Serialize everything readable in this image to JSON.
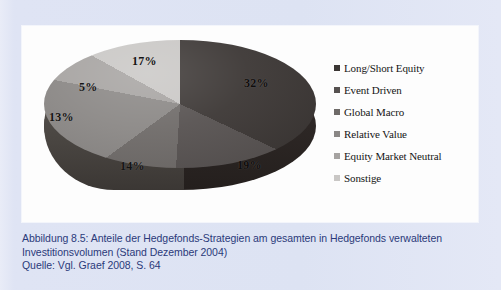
{
  "figure": {
    "panel_background": "#fdfdfd",
    "page_background": "#dfe4f4"
  },
  "legend": {
    "position": "right",
    "items": [
      {
        "label": "Long/Short Equity",
        "color": "#3b3634"
      },
      {
        "label": "Event Driven",
        "color": "#565150"
      },
      {
        "label": "Global Macro",
        "color": "#6e6a68"
      },
      {
        "label": "Relative Value",
        "color": "#8a8785"
      },
      {
        "label": "Equity Market Neutral",
        "color": "#a6a3a1"
      },
      {
        "label": "Sonstige",
        "color": "#c9c7c5"
      }
    ]
  },
  "caption": {
    "line1": "Abbildung 8.5:  Anteile der Hedgefonds-Strategien am gesamten in Hedgefonds verwalteten",
    "line2": "Investitionsvolumen (Stand Dezember 2004)",
    "line3": "Quelle: Vgl. Graef 2008, S. 64"
  },
  "chart_data": {
    "type": "pie",
    "title": "Anteile der Hedgefonds-Strategien am gesamten in Hedgefonds verwalteten Investitionsvolumen (Stand Dezember 2004)",
    "subtitle": "Quelle: Vgl. Graef 2008, S. 64",
    "xlabel": "",
    "ylabel": "",
    "grid": false,
    "legend_position": "right",
    "value_unit": "%",
    "start_angle_deg": 0,
    "direction": "clockwise",
    "three_d": true,
    "categories": [
      "Long/Short Equity",
      "Event Driven",
      "Global Macro",
      "Relative Value",
      "Equity Market Neutral",
      "Sonstige"
    ],
    "values": [
      32,
      19,
      14,
      13,
      5,
      17
    ],
    "labels": [
      "32%",
      "19%",
      "14%",
      "13%",
      "5%",
      "17%"
    ],
    "colors": [
      "#3b3634",
      "#565150",
      "#6e6a68",
      "#8a8785",
      "#a6a3a1",
      "#c9c7c5"
    ],
    "slice_label_positions": [
      {
        "label": "32%",
        "left": 212,
        "top": 44
      },
      {
        "label": "19%",
        "left": 205,
        "top": 126
      },
      {
        "label": "14%",
        "left": 88,
        "top": 127
      },
      {
        "label": "13%",
        "left": 17,
        "top": 78
      },
      {
        "label": "5%",
        "left": 47,
        "top": 48
      },
      {
        "label": "17%",
        "left": 100,
        "top": 22
      }
    ]
  }
}
